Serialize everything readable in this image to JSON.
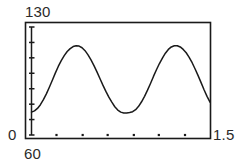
{
  "chart_data": {
    "type": "line",
    "title": "",
    "subtitle": "",
    "xlabel": "",
    "ylabel": "",
    "xlim": [
      60,
      1.5
    ],
    "ylim": [
      0,
      130
    ],
    "grid": false,
    "legend": null,
    "axis_labels": {
      "y_max": "130",
      "y_min": "0",
      "x_min": "60",
      "x_max": "1.5"
    },
    "y_ticks": [
      0,
      18.6,
      37.1,
      55.7,
      74.3,
      92.9,
      111.4,
      130
    ],
    "y_tick_labels": [
      "",
      "",
      "",
      "",
      "",
      "",
      "",
      ""
    ],
    "x_ticks": [
      0.21,
      0.43,
      0.64,
      0.86,
      1.07,
      1.29
    ],
    "x_tick_labels": [
      "",
      "",
      "",
      "",
      "",
      ""
    ],
    "series": [
      {
        "name": "curve",
        "color": "#1a1a1a",
        "x": [
          0.0,
          0.025,
          0.05,
          0.075,
          0.1,
          0.125,
          0.15,
          0.175,
          0.2,
          0.225,
          0.25,
          0.275,
          0.3,
          0.325,
          0.35,
          0.375,
          0.4,
          0.425,
          0.45,
          0.475,
          0.5,
          0.525,
          0.55,
          0.575,
          0.6,
          0.625,
          0.65,
          0.675,
          0.7,
          0.725,
          0.75,
          0.775,
          0.8,
          0.825,
          0.85,
          0.875,
          0.9,
          0.925,
          0.95,
          0.975,
          1.0,
          1.025,
          1.05,
          1.075,
          1.1,
          1.125,
          1.15,
          1.175,
          1.2,
          1.225,
          1.25,
          1.275,
          1.3,
          1.325,
          1.35,
          1.375,
          1.4,
          1.425,
          1.45,
          1.475,
          1.5
        ],
        "y": [
          27.5,
          29.0,
          32.0,
          36.5,
          42.5,
          49.5,
          57.5,
          66.0,
          74.5,
          82.5,
          89.5,
          95.5,
          100.5,
          104.0,
          106.5,
          107.5,
          107.0,
          105.0,
          101.5,
          96.5,
          90.5,
          83.5,
          76.0,
          68.0,
          60.0,
          52.5,
          45.5,
          39.5,
          34.0,
          30.0,
          27.5,
          26.5,
          26.5,
          27.0,
          28.0,
          30.5,
          34.5,
          40.0,
          46.5,
          54.0,
          62.0,
          70.5,
          78.5,
          86.0,
          92.5,
          98.5,
          103.0,
          106.0,
          107.5,
          107.5,
          106.0,
          103.0,
          99.0,
          93.5,
          87.0,
          79.5,
          71.5,
          63.0,
          54.5,
          46.5,
          39.5
        ]
      }
    ],
    "peaks": [
      {
        "x": 0.375,
        "y": 107.5
      },
      {
        "x": 1.225,
        "y": 107.5
      }
    ],
    "troughs": [
      {
        "x": 0.7875,
        "y": 26.5
      }
    ]
  }
}
